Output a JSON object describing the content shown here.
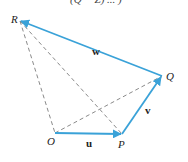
{
  "diagram": {
    "top_clipped_text": "(Q − Z) ... )",
    "colors": {
      "vector": "#3aa2d8",
      "dashed": "#8a8a8a",
      "text": "#222222"
    },
    "points": {
      "R": {
        "label": "R",
        "x": 20,
        "y": 21
      },
      "Q": {
        "label": "Q",
        "x": 162,
        "y": 76
      },
      "O": {
        "label": "O",
        "x": 55,
        "y": 133
      },
      "P": {
        "label": "P",
        "x": 122,
        "y": 134
      }
    },
    "vectors": [
      {
        "name": "u",
        "label": "u",
        "from": "O",
        "to": "P"
      },
      {
        "name": "v",
        "label": "v",
        "from": "P",
        "to": "Q"
      },
      {
        "name": "w",
        "label": "w",
        "from": "Q",
        "to": "R"
      }
    ],
    "dashed_segments": [
      {
        "from": "R",
        "to": "O"
      },
      {
        "from": "R",
        "to": "P"
      },
      {
        "from": "O",
        "to": "Q"
      }
    ]
  }
}
